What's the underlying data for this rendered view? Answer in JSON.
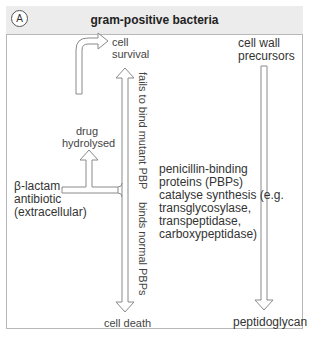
{
  "panel": {
    "badge": "A",
    "title": "gram-positive bacteria"
  },
  "labels": {
    "cell_survival_1": "cell",
    "cell_survival_2": "survival",
    "drug_hydrolysed_1": "drug",
    "drug_hydrolysed_2": "hydrolysed",
    "beta_lactam_1": "β-lactam",
    "beta_lactam_2": "antibiotic",
    "beta_lactam_3": "(extracellular)",
    "cell_death": "cell death",
    "fails_to_bind": "fails to bind mutant PBP",
    "binds_normal": "binds normal PBPs",
    "pbp_1": "penicillin-binding",
    "pbp_2": "proteins (PBPs)",
    "pbp_3": "catalyse synthesis (e.g.",
    "pbp_4": "transglycosylase,",
    "pbp_5": "transpeptidase,",
    "pbp_6": "carboxypeptidase)",
    "cell_wall_1": "cell wall",
    "cell_wall_2": "precursors",
    "peptidoglycan": "peptidoglycan"
  },
  "colors": {
    "border": "#b8b8b8",
    "header_bg": "#ececec",
    "arrow_stroke": "#8a8a8a",
    "text": "#444444"
  }
}
